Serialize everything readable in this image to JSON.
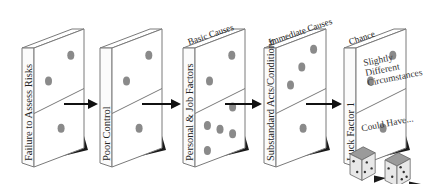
{
  "diagram": {
    "type": "domino-accident-causation",
    "dominoes": [
      {
        "id": "d1",
        "side_label": "Failure to Assess Risks",
        "top_label": "",
        "upper_pips": 2,
        "lower_pips": 1
      },
      {
        "id": "d2",
        "side_label": "Poor Control",
        "top_label": "",
        "upper_pips": 2,
        "lower_pips": 1
      },
      {
        "id": "d3",
        "side_label": "Personal & Job Factors",
        "top_label": "Basic Causes",
        "upper_pips": 2,
        "lower_pips": 5
      },
      {
        "id": "d4",
        "side_label": "Substandard Acts/Conditions",
        "top_label": "Immediate Causes",
        "upper_pips": 3,
        "lower_pips": 1
      },
      {
        "id": "d5",
        "side_label": "Luck Factor 1",
        "top_label": "Chance",
        "upper_pips": 2,
        "lower_pips": 1,
        "upper_text": [
          "Slightly",
          "Different",
          "Circumstances"
        ],
        "lower_text": "Could Have..."
      }
    ],
    "arrows": 4,
    "dice": {
      "count": 2,
      "label": "dice-chance"
    },
    "colors": {
      "pip": "#8a8a8a",
      "outline": "#7a7a7a",
      "shadow": "#1a1a1a",
      "arrow": "#111111"
    }
  }
}
